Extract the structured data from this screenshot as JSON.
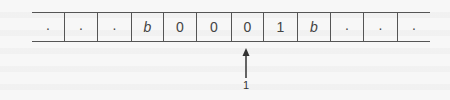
{
  "diagram": {
    "type": "turing-machine-tape",
    "tape": {
      "cells": [
        ".",
        ".",
        ".",
        "b",
        "0",
        "0",
        "0",
        "1",
        "b",
        ".",
        ".",
        "."
      ],
      "cell_edges_px": [
        32,
        64,
        97,
        131,
        163,
        196,
        231,
        263,
        297,
        330,
        363,
        397,
        430
      ]
    },
    "head": {
      "position_index": 6,
      "label": "1",
      "icon": "up-arrow-icon"
    },
    "colors": {
      "line": "#555555",
      "text": "#444444",
      "background": "#f7f7f7"
    }
  }
}
